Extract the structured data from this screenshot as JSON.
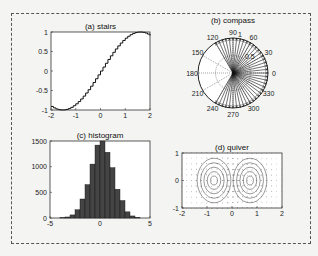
{
  "chart_data": [
    {
      "type": "line",
      "subtype": "stairs",
      "title": "(a) stairs",
      "xlabel": "",
      "ylabel": "",
      "xlim": [
        -2,
        2
      ],
      "ylim": [
        -1,
        1
      ],
      "xticks": [
        "-2",
        "-1",
        "0",
        "1",
        "2"
      ],
      "yticks": [
        "-1",
        "-0.5",
        "0",
        "0.5",
        "1"
      ],
      "function": "sin(x)",
      "x_range": [
        -2,
        2
      ],
      "steps": 40
    },
    {
      "type": "polar",
      "subtype": "compass",
      "title": "(b) compass",
      "angle_labels": [
        "0",
        "30",
        "60",
        "90",
        "120",
        "150",
        "180",
        "210",
        "240",
        "270",
        "300",
        "330"
      ],
      "radius_labels": [
        "0.5",
        "1"
      ],
      "rays_angle_range_deg": [
        -120,
        120
      ],
      "ray_count": 41,
      "ray_magnitude": 1
    },
    {
      "type": "bar",
      "subtype": "histogram",
      "title": "(c) histogram",
      "xlim": [
        -5,
        5
      ],
      "ylim": [
        0,
        1500
      ],
      "xticks": [
        "-5",
        "0",
        "5"
      ],
      "yticks": [
        "0",
        "500",
        "1000",
        "1500"
      ],
      "bin_centers": [
        -3.75,
        -3.25,
        -2.75,
        -2.25,
        -1.75,
        -1.25,
        -0.75,
        -0.25,
        0.25,
        0.75,
        1.25,
        1.75,
        2.25,
        2.75,
        3.25,
        3.75
      ],
      "values": [
        5,
        20,
        60,
        160,
        370,
        650,
        1050,
        1420,
        1500,
        1280,
        980,
        560,
        340,
        120,
        40,
        10
      ],
      "bar_color": "#444444"
    },
    {
      "type": "quiver",
      "title": "(d) quiver",
      "xlim": [
        -2,
        2
      ],
      "ylim": [
        -1,
        1
      ],
      "xticks": [
        "-2",
        "-1",
        "0",
        "1",
        "2"
      ],
      "yticks": [
        "-1",
        "0",
        "1"
      ],
      "field": "gradient of x*exp(-x^2-y^2) with contours"
    }
  ]
}
